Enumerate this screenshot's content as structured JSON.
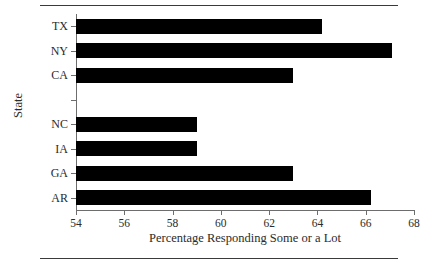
{
  "chart_data": {
    "type": "bar",
    "orientation": "horizontal",
    "title": "",
    "xlabel": "Percentage Responding Some or a Lot",
    "ylabel": "State",
    "categories": [
      "TX",
      "NY",
      "CA",
      "",
      "NC",
      "IA",
      "GA",
      "AR"
    ],
    "values": [
      64.2,
      67.1,
      63.0,
      null,
      59.0,
      59.0,
      63.0,
      66.2
    ],
    "xlim": [
      54,
      68
    ],
    "xticks": [
      54,
      56,
      58,
      60,
      62,
      64,
      66,
      68
    ],
    "xticklabels": [
      "54",
      "56",
      "58",
      "60",
      "62",
      "64",
      "66",
      "68"
    ],
    "grid": false,
    "legend": false,
    "bar_color": "#000000",
    "axis_color": "#6d6d6d",
    "rule_color": "#3a3a3a",
    "note": "One unlabeled category slot with no bar appears between CA and NC"
  }
}
